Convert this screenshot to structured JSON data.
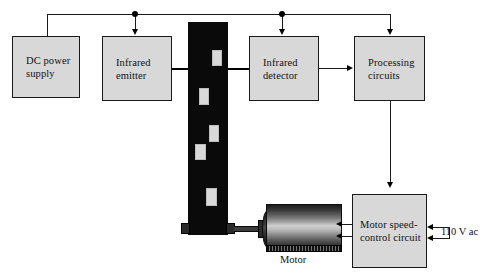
{
  "diagram": {
    "blocks": [
      {
        "id": "dc_power_supply",
        "label": "DC power\nsupply"
      },
      {
        "id": "infrared_emitter",
        "label": "Infrared\nemitter"
      },
      {
        "id": "infrared_detector",
        "label": "Infrared\ndetector"
      },
      {
        "id": "processing_circuits",
        "label": "Processing\ncircuits"
      },
      {
        "id": "motor_speed_control_circuit",
        "label": "Motor speed-\ncontrol circuit"
      }
    ],
    "labels": {
      "motor": "Motor",
      "ac_supply": "110 V ac"
    },
    "colors": {
      "block_fill": "#d8d8d8",
      "line": "#1a1a1a",
      "strip": "#0a0a0a",
      "marker": "#d9d9d9",
      "background": "#ffffff"
    },
    "strip": {
      "name": "perforated-encoder-belt",
      "markers": 5
    }
  }
}
